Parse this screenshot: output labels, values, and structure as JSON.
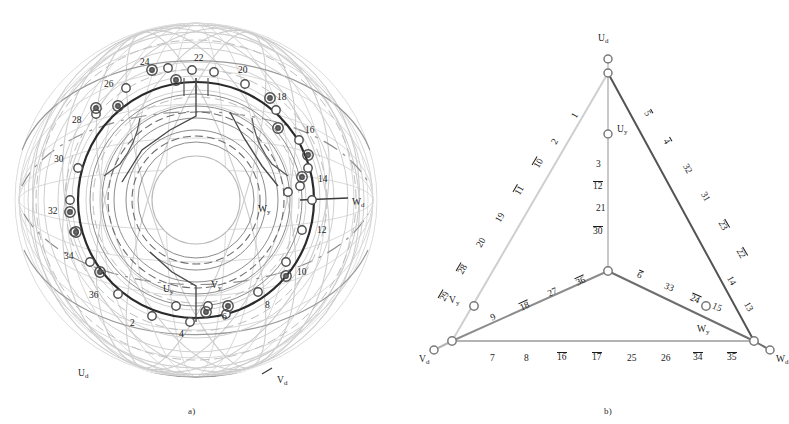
{
  "figure": {
    "panel_a": {
      "caption": "a)",
      "terminal_labels": [
        {
          "name": "W_d",
          "text": "W",
          "sub": "d",
          "x": 352,
          "y": 198
        },
        {
          "name": "U_d",
          "text": "U",
          "sub": "d",
          "x": 78,
          "y": 369
        },
        {
          "name": "V_d",
          "text": "V",
          "sub": "d",
          "x": 277,
          "y": 376
        },
        {
          "name": "W_y",
          "text": "W",
          "sub": "y",
          "x": 258,
          "y": 205
        },
        {
          "name": "U_y",
          "text": "U",
          "sub": "y",
          "x": 163,
          "y": 285
        },
        {
          "name": "V_y",
          "text": "V",
          "sub": "y",
          "x": 211,
          "y": 281
        }
      ],
      "slot_numbers": [
        {
          "value": "24",
          "x": 140,
          "y": 58
        },
        {
          "value": "22",
          "x": 194,
          "y": 54
        },
        {
          "value": "20",
          "x": 238,
          "y": 66
        },
        {
          "value": "26",
          "x": 104,
          "y": 80
        },
        {
          "value": "18",
          "x": 277,
          "y": 93
        },
        {
          "value": "28",
          "x": 72,
          "y": 116
        },
        {
          "value": "16",
          "x": 305,
          "y": 126
        },
        {
          "value": "30",
          "x": 54,
          "y": 155
        },
        {
          "value": "14",
          "x": 318,
          "y": 175
        },
        {
          "value": "32",
          "x": 48,
          "y": 207
        },
        {
          "value": "12",
          "x": 317,
          "y": 226
        },
        {
          "value": "34",
          "x": 64,
          "y": 252
        },
        {
          "value": "10",
          "x": 297,
          "y": 268
        },
        {
          "value": "36",
          "x": 89,
          "y": 291
        },
        {
          "value": "8",
          "x": 265,
          "y": 301
        },
        {
          "value": "2",
          "x": 130,
          "y": 319
        },
        {
          "value": "4",
          "x": 179,
          "y": 330
        },
        {
          "value": "6",
          "x": 222,
          "y": 313
        }
      ]
    },
    "panel_b": {
      "caption": "b)",
      "nodes": [
        {
          "name": "U_d",
          "text": "U",
          "sub": "d",
          "label_x": 598,
          "label_y": 34,
          "cx": 608,
          "cy": 59,
          "r": 4.0,
          "filled": false
        },
        {
          "name": "U_apex",
          "text": "",
          "sub": "",
          "label_x": 0,
          "label_y": 0,
          "cx": 608,
          "cy": 73,
          "r": 4.0,
          "filled": false
        },
        {
          "name": "U_y",
          "text": "U",
          "sub": "y",
          "label_x": 617,
          "label_y": 125,
          "cx": 608,
          "cy": 134,
          "r": 4.0,
          "filled": false
        },
        {
          "name": "center",
          "text": "",
          "sub": "",
          "label_x": 0,
          "label_y": 0,
          "cx": 608,
          "cy": 271,
          "r": 4.2,
          "filled": false
        },
        {
          "name": "V_y",
          "text": "V",
          "sub": "y",
          "label_x": 449,
          "label_y": 296,
          "cx": 474,
          "cy": 306,
          "r": 4.2,
          "filled": false
        },
        {
          "name": "V_corner",
          "text": "",
          "sub": "",
          "label_x": 0,
          "label_y": 0,
          "cx": 452,
          "cy": 341,
          "r": 4.2,
          "filled": false
        },
        {
          "name": "V_d",
          "text": "V",
          "sub": "d",
          "label_x": 419,
          "label_y": 355,
          "cx": 434,
          "cy": 350,
          "r": 4.0,
          "filled": false
        },
        {
          "name": "W_y",
          "text": "W",
          "sub": "y",
          "label_x": 697,
          "label_y": 325,
          "cx": 706,
          "cy": 306,
          "r": 4.2,
          "filled": false
        },
        {
          "name": "W_corner",
          "text": "",
          "sub": "",
          "label_x": 0,
          "label_y": 0,
          "cx": 754,
          "cy": 341,
          "r": 4.2,
          "filled": false
        },
        {
          "name": "W_d",
          "text": "W",
          "sub": "d",
          "label_x": 776,
          "label_y": 355,
          "cx": 770,
          "cy": 350,
          "r": 4.0,
          "filled": false
        }
      ],
      "edges": [
        {
          "name": "edge-U-to-Vd",
          "x1": 608,
          "y1": 73,
          "x2": 452,
          "y2": 341,
          "color": "#cfcfcf",
          "width": 2.0
        },
        {
          "name": "edge-U-to-Wd",
          "x1": 608,
          "y1": 73,
          "x2": 754,
          "y2": 341,
          "color": "#545454",
          "width": 2.0
        },
        {
          "name": "edge-Ud-stub",
          "x1": 608,
          "y1": 59,
          "x2": 608,
          "y2": 73,
          "color": "#cfcfcf",
          "width": 2.0
        },
        {
          "name": "edge-U-vertical",
          "x1": 608,
          "y1": 73,
          "x2": 608,
          "y2": 271,
          "color": "#c9c9c9",
          "width": 2.0
        },
        {
          "name": "edge-center-to-Vy",
          "x1": 608,
          "y1": 271,
          "x2": 452,
          "y2": 341,
          "color": "#8c8c8c",
          "width": 2.0
        },
        {
          "name": "edge-center-to-Wy",
          "x1": 608,
          "y1": 271,
          "x2": 754,
          "y2": 341,
          "color": "#6e6e6e",
          "width": 2.0
        },
        {
          "name": "edge-base",
          "x1": 452,
          "y1": 341,
          "x2": 754,
          "y2": 341,
          "color": "#b4b4b4",
          "width": 2.0
        },
        {
          "name": "edge-Vd-stub",
          "x1": 434,
          "y1": 350,
          "x2": 452,
          "y2": 341,
          "color": "#b4b4b4",
          "width": 2.0
        },
        {
          "name": "edge-Wd-stub",
          "x1": 754,
          "y1": 341,
          "x2": 770,
          "y2": 350,
          "color": "#6e6e6e",
          "width": 2.0
        }
      ],
      "edge_numbers": {
        "left_leg": [
          {
            "value": "1",
            "over": false,
            "x": 573,
            "y": 111,
            "rot": -60
          },
          {
            "value": "2",
            "over": false,
            "x": 553,
            "y": 137,
            "rot": -60
          },
          {
            "value": "10",
            "over": true,
            "x": 534,
            "y": 158,
            "rot": -60
          },
          {
            "value": "11",
            "over": true,
            "x": 515,
            "y": 185,
            "rot": -60
          },
          {
            "value": "19",
            "over": false,
            "x": 496,
            "y": 213,
            "rot": -60
          },
          {
            "value": "20",
            "over": false,
            "x": 477,
            "y": 238,
            "rot": -60
          },
          {
            "value": "28",
            "over": true,
            "x": 458,
            "y": 264,
            "rot": -60
          },
          {
            "value": "29",
            "over": true,
            "x": 440,
            "y": 291,
            "rot": -60
          }
        ],
        "right_leg": [
          {
            "value": "5",
            "over": true,
            "x": 645,
            "y": 108,
            "rot": 60
          },
          {
            "value": "4",
            "over": true,
            "x": 664,
            "y": 136,
            "rot": 60
          },
          {
            "value": "32",
            "over": false,
            "x": 682,
            "y": 164,
            "rot": 60
          },
          {
            "value": "31",
            "over": false,
            "x": 700,
            "y": 192,
            "rot": 60
          },
          {
            "value": "23",
            "over": true,
            "x": 718,
            "y": 220,
            "rot": 60
          },
          {
            "value": "22",
            "over": true,
            "x": 736,
            "y": 248,
            "rot": 60
          },
          {
            "value": "14",
            "over": false,
            "x": 726,
            "y": 276,
            "rot": 60
          },
          {
            "value": "13",
            "over": false,
            "x": 743,
            "y": 302,
            "rot": 60
          }
        ],
        "middle_vertical": [
          {
            "value": "3",
            "over": false,
            "x": 596,
            "y": 160
          },
          {
            "value": "12",
            "over": true,
            "x": 593,
            "y": 181
          },
          {
            "value": "21",
            "over": false,
            "x": 596,
            "y": 204
          },
          {
            "value": "30",
            "over": true,
            "x": 593,
            "y": 226
          }
        ],
        "left_inner": [
          {
            "value": "9",
            "over": false,
            "x": 491,
            "y": 313,
            "rot": -24
          },
          {
            "value": "18",
            "over": true,
            "x": 520,
            "y": 301,
            "rot": -24
          },
          {
            "value": "27",
            "over": false,
            "x": 548,
            "y": 288,
            "rot": -24
          },
          {
            "value": "36",
            "over": true,
            "x": 576,
            "y": 276,
            "rot": -24
          }
        ],
        "right_inner": [
          {
            "value": "6",
            "over": true,
            "x": 637,
            "y": 270,
            "rot": 24
          },
          {
            "value": "33",
            "over": false,
            "x": 664,
            "y": 283,
            "rot": 24
          },
          {
            "value": "24",
            "over": true,
            "x": 690,
            "y": 294,
            "rot": 24
          },
          {
            "value": "15",
            "over": false,
            "x": 712,
            "y": 303,
            "rot": 24
          }
        ],
        "base": [
          {
            "value": "7",
            "over": false,
            "x": 490,
            "y": 354
          },
          {
            "value": "8",
            "over": false,
            "x": 524,
            "y": 354
          },
          {
            "value": "16",
            "over": true,
            "x": 557,
            "y": 352
          },
          {
            "value": "17",
            "over": true,
            "x": 592,
            "y": 352
          },
          {
            "value": "25",
            "over": false,
            "x": 627,
            "y": 354
          },
          {
            "value": "26",
            "over": false,
            "x": 661,
            "y": 354
          },
          {
            "value": "34",
            "over": true,
            "x": 693,
            "y": 352
          },
          {
            "value": "35",
            "over": true,
            "x": 727,
            "y": 352
          }
        ]
      }
    }
  },
  "colors": {
    "ink": "#1c1c1c",
    "light_gray": "#cfcfcf",
    "mid_gray": "#8c8c8c",
    "dark_gray": "#545454",
    "faint": "#d9d9d9"
  }
}
